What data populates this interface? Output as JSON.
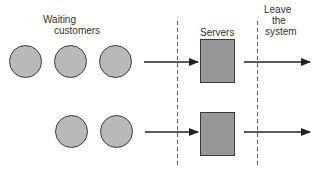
{
  "labels": {
    "waiting_line1": "Waiting",
    "waiting_line2": "customers",
    "servers": "Servers",
    "leave_line1": "Leave",
    "leave_line2": "the",
    "leave_line3": "system"
  },
  "rows": [
    {
      "customers": 3,
      "servers": 1
    },
    {
      "customers": 2,
      "servers": 1
    }
  ],
  "colors": {
    "customer_fill": "#b9b9b9",
    "server_fill": "#979797",
    "stroke": "#2a2a2a"
  }
}
